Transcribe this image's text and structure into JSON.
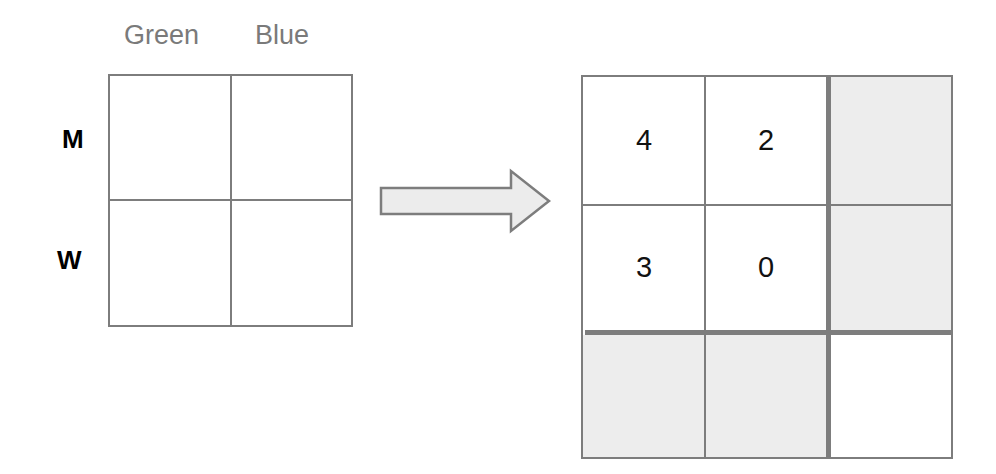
{
  "left_table": {
    "column_headers": [
      "Green",
      "Blue"
    ],
    "row_headers": [
      "M",
      "W"
    ],
    "cells": [
      [
        "",
        ""
      ],
      [
        "",
        ""
      ]
    ]
  },
  "arrow": {
    "direction": "right",
    "icon": "right-arrow-icon"
  },
  "right_table": {
    "cells": [
      [
        "4",
        "2",
        ""
      ],
      [
        "3",
        "0",
        ""
      ],
      [
        "",
        "",
        ""
      ]
    ],
    "shaded_cells": [
      [
        0,
        2
      ],
      [
        1,
        2
      ],
      [
        2,
        0
      ],
      [
        2,
        1
      ]
    ],
    "colors": {
      "border": "#7d7d7d",
      "shaded": "#ededed"
    }
  }
}
